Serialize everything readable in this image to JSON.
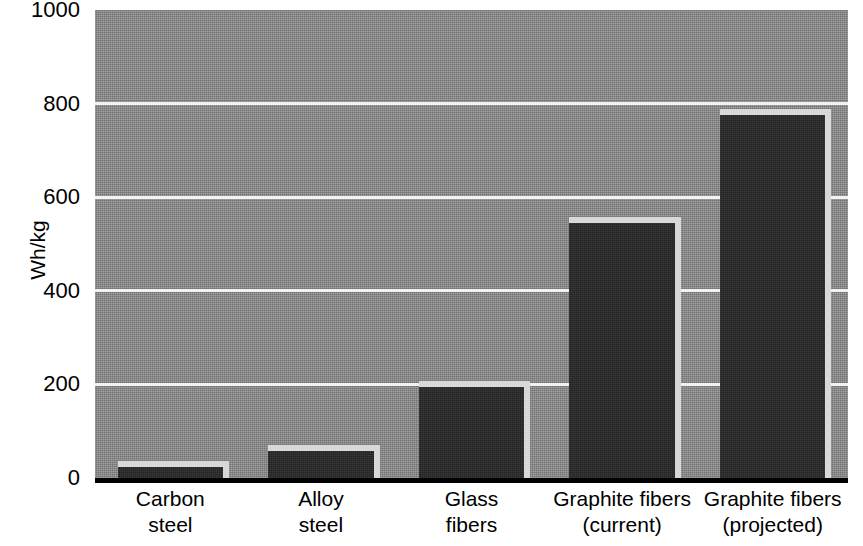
{
  "chart_data": {
    "type": "bar",
    "title": "",
    "subtitle": "",
    "xlabel": "",
    "ylabel": "Wh/kg",
    "categories": [
      "Carbon steel",
      "Alloy steel",
      "Glass fibers",
      "Graphite fibers (current)",
      "Graphite fibers (projected)"
    ],
    "category_lines": [
      [
        "Carbon",
        "steel"
      ],
      [
        "Alloy",
        "steel"
      ],
      [
        "Glass",
        "fibers"
      ],
      [
        "Graphite fibers",
        "(current)"
      ],
      [
        "Graphite fibers",
        "(projected)"
      ]
    ],
    "values": [
      23,
      57,
      194,
      545,
      775
    ],
    "ylim": [
      0,
      1000
    ],
    "yticks": [
      0,
      200,
      400,
      600,
      800,
      1000
    ],
    "ytick_labels": [
      "0",
      "200",
      "400",
      "600",
      "800",
      "1000"
    ],
    "gridlines_y": [
      200,
      400,
      600,
      800
    ],
    "grid": true,
    "legend": null,
    "legend_position": "none",
    "annotations": []
  },
  "style": {
    "plot_background": "#8c8c8c",
    "bar_color": "#262626",
    "bar_highlight_color": "#d8d8d8",
    "gridline_color": "#f2f2f2",
    "axis_color": "#000000",
    "text_color": "#000000",
    "page_background": "#ffffff"
  }
}
